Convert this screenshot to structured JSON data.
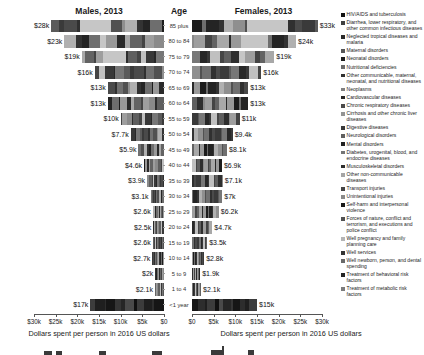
{
  "titles": {
    "males": "Males, 2013",
    "age": "Age",
    "females": "Females, 2013"
  },
  "age_groups": [
    "85 plus",
    "80 to 84",
    "75 to 79",
    "70 to 74",
    "65 to 69",
    "60 to 64",
    "55 to 59",
    "50 to 54",
    "45 to 49",
    "40 to 44",
    "35 to 39",
    "30 to 34",
    "25 to 29",
    "20 to 24",
    "15 to 19",
    "10 to 14",
    "5 to 9",
    "1 to 4",
    "<1 year"
  ],
  "males": {
    "labels": [
      "$28k",
      "$23k",
      "$19k",
      "$16k",
      "$13k",
      "$13k",
      "$10k",
      "$7.7k",
      "$5.9k",
      "$4.6k",
      "$3.9k",
      "$3.1k",
      "$2.6k",
      "$2.5k",
      "$2.6k",
      "$2.7k",
      "$2k",
      "$2.1k",
      "$17k"
    ],
    "values_k": [
      28,
      23,
      19,
      16,
      13,
      13,
      10,
      7.7,
      5.9,
      4.6,
      3.9,
      3.1,
      2.6,
      2.5,
      2.6,
      2.7,
      2,
      2.1,
      17
    ]
  },
  "females": {
    "labels": [
      "$33k",
      "$24k",
      "$19k",
      "$16k",
      "$13k",
      "$13k",
      "$11k",
      "$9.4k",
      "$8.1k",
      "$6.9k",
      "$7.1k",
      "$7k",
      "$6.2k",
      "$4.7k",
      "$3.5k",
      "$2.8k",
      "$1.9k",
      "$2.1k",
      "$15k"
    ],
    "values_k": [
      33,
      24,
      19,
      16,
      13,
      13,
      11,
      9.4,
      8.1,
      6.9,
      7.1,
      7,
      6.2,
      4.7,
      3.5,
      2.8,
      1.9,
      2.1,
      15
    ]
  },
  "axis": {
    "ticks_male": [
      "$30k",
      "$25k",
      "$20k",
      "$15k",
      "$10k",
      "$5k",
      "$0"
    ],
    "ticks_female": [
      "$0",
      "$5k",
      "$10k",
      "$15k",
      "$20k",
      "$25k",
      "$30k"
    ],
    "caption": "Dollars spent per person in 2016 US dollars",
    "max_k": 30
  },
  "legend": {
    "items": [
      {
        "label": "HIV/AIDS and tuberculosis",
        "color": "#111111"
      },
      {
        "label": "Diarrhea, lower respiratory, and other common infectious diseases",
        "color": "#3f3f3f"
      },
      {
        "label": "Neglected tropical diseases and malaria",
        "color": "#2a2a2a"
      },
      {
        "label": "Maternal disorders",
        "color": "#565656"
      },
      {
        "label": "Neonatal disorders",
        "color": "#1d1d1d"
      },
      {
        "label": "Nutritional deficiencies",
        "color": "#6b6b6b"
      },
      {
        "label": "Other communicable, maternal, neonatal, and nutritional diseases",
        "color": "#303030"
      },
      {
        "label": "Neoplasms",
        "color": "#808080"
      },
      {
        "label": "Cardiovascular diseases",
        "color": "#262626"
      },
      {
        "label": "Chronic respiratory diseases",
        "color": "#4a4a4a"
      },
      {
        "label": "Cirrhosis and other chronic liver diseases",
        "color": "#949494"
      },
      {
        "label": "Digestive diseases",
        "color": "#383838"
      },
      {
        "label": "Neurological disorders",
        "color": "#5f5f5f"
      },
      {
        "label": "Mental disorders",
        "color": "#202020"
      },
      {
        "label": "Diabetes, urogenital, blood, and endocrine diseases",
        "color": "#757575"
      },
      {
        "label": "Musculoskeletal disorders",
        "color": "#2e2e2e"
      },
      {
        "label": "Other non-communicable diseases",
        "color": "#a5a5a5"
      },
      {
        "label": "Transport injuries",
        "color": "#444444"
      },
      {
        "label": "Unintentional injuries",
        "color": "#8a8a8a"
      },
      {
        "label": "Self-harm and interpersonal violence",
        "color": "#181818"
      },
      {
        "label": "Forces of nature, conflict and terrorism, and executions and police conflict",
        "color": "#515151"
      },
      {
        "label": "Well pregnancy and family planning care",
        "color": "#b5b5b5"
      },
      {
        "label": "Well services",
        "color": "#343434"
      },
      {
        "label": "Well newborn, person, and dental spending",
        "color": "#696969"
      },
      {
        "label": "Treatment of behavioral risk factors",
        "color": "#242424"
      },
      {
        "label": "Treatment of metabolic risk factors",
        "color": "#7c7c7c"
      }
    ]
  },
  "render": {
    "segment_palette": [
      "#1c1c1c",
      "#4a4a4a",
      "#2e2e2e",
      "#6e6e6e",
      "#3a3a3a",
      "#8a8a8a",
      "#242424",
      "#5a5a5a",
      "#9e9e9e",
      "#333333",
      "#777777",
      "#444444",
      "#b0b0b0",
      "#282828",
      "#636363",
      "#8f8f8f",
      "#383838",
      "#a8a8a8",
      "#515151",
      "#c0c0c0",
      "#2a2a2a",
      "#707070",
      "#454545",
      "#999999",
      "#303030",
      "#5f5f5f"
    ],
    "dark_palette": [
      "#161616",
      "#2d2d2d",
      "#1f1f1f",
      "#3c3c3c",
      "#111111",
      "#4a4a4a",
      "#262626",
      "#353535"
    ]
  },
  "chart_data": {
    "type": "bar",
    "subtype": "stacked horizontal population-pyramid, two panels",
    "panels": [
      "Males, 2013",
      "Females, 2013"
    ],
    "categories": [
      "85 plus",
      "80 to 84",
      "75 to 79",
      "70 to 74",
      "65 to 69",
      "60 to 64",
      "55 to 59",
      "50 to 54",
      "45 to 49",
      "40 to 44",
      "35 to 39",
      "30 to 34",
      "25 to 29",
      "20 to 24",
      "15 to 19",
      "10 to 14",
      "5 to 9",
      "1 to 4",
      "<1 year"
    ],
    "series": [
      {
        "name": "Males, 2013",
        "values_usd": [
          28000,
          23000,
          19000,
          16000,
          13000,
          13000,
          10000,
          7700,
          5900,
          4600,
          3900,
          3100,
          2600,
          2500,
          2600,
          2700,
          2000,
          2100,
          17000
        ]
      },
      {
        "name": "Females, 2013",
        "values_usd": [
          33000,
          24000,
          19000,
          16000,
          13000,
          13000,
          11000,
          9400,
          8100,
          6900,
          7100,
          7000,
          6200,
          4700,
          3500,
          2800,
          1900,
          2100,
          15000
        ]
      }
    ],
    "xlabel": "Dollars spent per person in 2016 US dollars",
    "ylabel": "Age",
    "xlim_usd": [
      0,
      30000
    ],
    "legend_position": "right",
    "grid": false,
    "stack_categories": [
      "HIV/AIDS and tuberculosis",
      "Diarrhea, lower respiratory, and other common infectious diseases",
      "Neglected tropical diseases and malaria",
      "Maternal disorders",
      "Neonatal disorders",
      "Nutritional deficiencies",
      "Other communicable, maternal, neonatal, and nutritional diseases",
      "Neoplasms",
      "Cardiovascular diseases",
      "Chronic respiratory diseases",
      "Cirrhosis and other chronic liver diseases",
      "Digestive diseases",
      "Neurological disorders",
      "Mental disorders",
      "Diabetes, urogenital, blood, and endocrine diseases",
      "Musculoskeletal disorders",
      "Other non-communicable diseases",
      "Transport injuries",
      "Unintentional injuries",
      "Self-harm and interpersonal violence",
      "Forces of nature, conflict and terrorism, and executions and police conflict",
      "Well pregnancy and family planning care",
      "Well services",
      "Well newborn, person, and dental spending",
      "Treatment of behavioral risk factors",
      "Treatment of metabolic risk factors"
    ]
  }
}
